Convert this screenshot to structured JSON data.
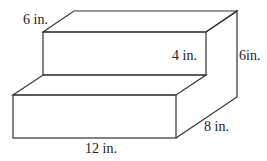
{
  "diagram": {
    "labels": {
      "top_depth": "6 in.",
      "step_height": "4 in.",
      "total_height": "6in.",
      "depth": "8 in.",
      "width": "12 in."
    },
    "stroke_color": "#333333"
  }
}
